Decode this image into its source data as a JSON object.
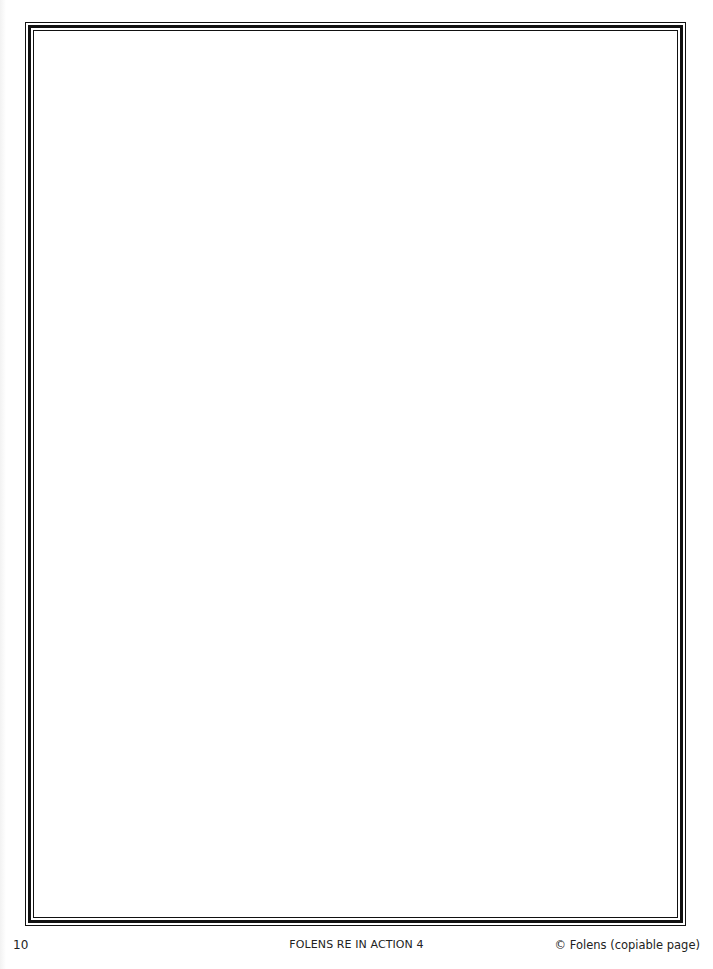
{
  "page": {
    "background": "#ffffff",
    "frame": {
      "style": "triple-line",
      "color": "#111111"
    },
    "content_area": {
      "text": ""
    }
  },
  "footer": {
    "page_number": "10",
    "title": "FOLENS RE IN ACTION 4",
    "copyright": "© Folens (copiable page)"
  }
}
